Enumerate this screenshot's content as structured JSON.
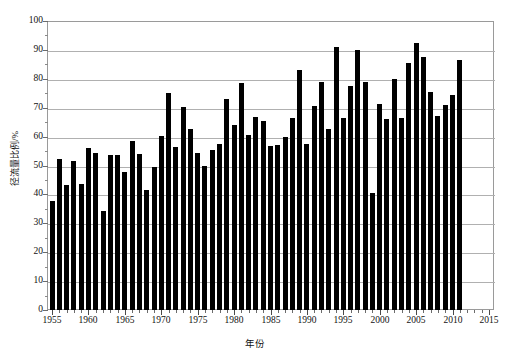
{
  "chart_data": {
    "type": "bar",
    "title": "",
    "subtitle": "",
    "xlabel": "年份",
    "ylabel": "径流量比例/%",
    "xlim": [
      1954.3,
      2015.7
    ],
    "ylim": [
      0,
      100
    ],
    "grid": true,
    "legend": null,
    "bar_color": "#000000",
    "axis_color": "#9a9a9a",
    "grid_color": "#b0b0b0",
    "y_ticks": [
      0,
      10,
      20,
      30,
      40,
      50,
      60,
      70,
      80,
      90,
      100
    ],
    "y_tick_labels": [
      "0",
      "10",
      "20",
      "30",
      "40",
      "50",
      "60",
      "70",
      "80",
      "90",
      "100"
    ],
    "y_minor_ticks": [
      5,
      15,
      25,
      35,
      45,
      55,
      65,
      75,
      85,
      95
    ],
    "x_ticks": [
      1955,
      1960,
      1965,
      1970,
      1975,
      1980,
      1985,
      1990,
      1995,
      2000,
      2005,
      2010,
      2015
    ],
    "x_tick_labels": [
      "1955",
      "1960",
      "1965",
      "1970",
      "1975",
      "1980",
      "1985",
      "1990",
      "1995",
      "2000",
      "2005",
      "2010",
      "2015"
    ],
    "categories": [
      1955,
      1956,
      1957,
      1958,
      1959,
      1960,
      1961,
      1962,
      1963,
      1964,
      1965,
      1966,
      1967,
      1968,
      1969,
      1970,
      1971,
      1972,
      1973,
      1974,
      1975,
      1976,
      1977,
      1978,
      1979,
      1980,
      1981,
      1982,
      1983,
      1984,
      1985,
      1986,
      1987,
      1988,
      1989,
      1990,
      1991,
      1992,
      1993,
      1994,
      1995,
      1996,
      1997,
      1998,
      1999,
      2000,
      2001,
      2002,
      2003,
      2004,
      2005,
      2006,
      2007,
      2008,
      2009,
      2010,
      2011,
      2012,
      2013,
      2014,
      2015
    ],
    "values": [
      37.8,
      52.3,
      43.2,
      51.6,
      43.6,
      56.2,
      54.5,
      34.4,
      53.7,
      53.7,
      47.8,
      58.6,
      53.9,
      41.5,
      49.4,
      60.3,
      75.0,
      56.4,
      70.2,
      62.7,
      54.5,
      49.9,
      55.3,
      57.5,
      73.0,
      63.9,
      78.6,
      60.5,
      66.7,
      65.4,
      56.7,
      57.0,
      59.8,
      66.3,
      83.2,
      57.5,
      70.5,
      79.0,
      62.6,
      91.0,
      66.5,
      77.5,
      90.0,
      79.0,
      40.6,
      71.3,
      66.2,
      80.0,
      66.3,
      85.4,
      92.3,
      87.4,
      75.4,
      67.1,
      71.0,
      74.3,
      86.4,
      0,
      0,
      0,
      0
    ]
  }
}
